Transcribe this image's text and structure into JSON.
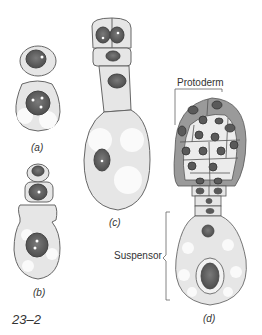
{
  "figure": {
    "number": "23–2",
    "panels": [
      {
        "id": "a",
        "label": "(a)"
      },
      {
        "id": "b",
        "label": "(b)"
      },
      {
        "id": "c",
        "label": "(c)"
      },
      {
        "id": "d",
        "label": "(d)"
      }
    ],
    "annotations": {
      "protoderm": "Protoderm",
      "suspensor": "Suspensor"
    },
    "colors": {
      "outline": "#555555",
      "cytoplasm": "#e8e8e8",
      "vacuole": "#fafafa",
      "nucleus": "#6a6a6a",
      "protoderm_fill": "#9a9a9a"
    }
  }
}
